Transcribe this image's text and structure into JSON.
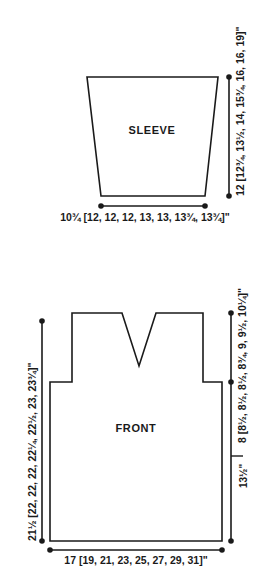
{
  "document": {
    "type": "knitting-schematic",
    "background_color": "#ffffff",
    "line_color": "#1a1a1a"
  },
  "pieces": [
    {
      "id": "sleeve",
      "label": "SLEEVE",
      "shape": "tapered-trapezoid",
      "dimensions": {
        "height_label": "12 [12¾, 13½, 14, 15¾, 16, 16, 19]\"",
        "height_label_position": "right-vertical",
        "width_label": "10¾ [12, 12, 12, 13, 13, 13¾, 13¾]\"",
        "width_label_position": "bottom"
      }
    },
    {
      "id": "front",
      "label": "FRONT",
      "shape": "v-neck-body-with-armholes",
      "dimensions": {
        "total_height_label": "21½ [22, 22, 22, 22¼, 22½, 23, 23¾]\"",
        "total_height_label_position": "left-vertical",
        "yoke_height_label": "8 [8½, 8½, 8½, 8¾, 9, 9½, 10¼]\"",
        "yoke_height_label_position": "right-vertical-top",
        "body_height_label": "13½\"",
        "body_height_label_position": "right-vertical-bottom",
        "width_label": "17 [19, 21, 23, 25, 27, 29, 31]\"",
        "width_label_position": "bottom"
      }
    }
  ],
  "measurements": {
    "sleeve_height": "12 [12¾, 13½, 14, 15¾, 16, 16, 19]\"",
    "sleeve_lower_width": "10¾ [12, 12, 12, 13, 13, 13¾, 13¾]\"",
    "front_total_height": "21½ [22, 22, 22, 22¼, 22½, 23, 23¾]\"",
    "front_yoke_height": "8 [8½, 8½, 8½, 8¾, 9, 9½, 10¼]\"",
    "front_body_height": "13½\"",
    "front_width": "17 [19, 21, 23, 25, 27, 29, 31]\""
  }
}
